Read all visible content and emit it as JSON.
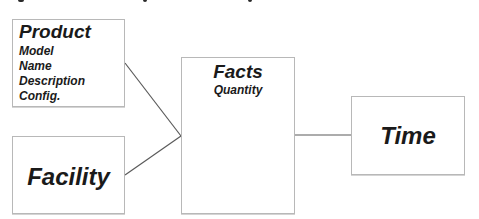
{
  "diagram": {
    "type": "star-schema",
    "entities": {
      "product": {
        "title": "Product",
        "attributes": [
          "Model",
          "Name",
          "Description",
          "Config."
        ]
      },
      "facility": {
        "title": "Facility",
        "attributes": []
      },
      "facts": {
        "title": "Facts",
        "attributes": [
          "Quantity"
        ]
      },
      "time": {
        "title": "Time",
        "attributes": []
      }
    },
    "relationships": [
      {
        "from": "Product",
        "to": "Facts"
      },
      {
        "from": "Facility",
        "to": "Facts"
      },
      {
        "from": "Facts",
        "to": "Time"
      }
    ],
    "colors": {
      "box_border": "#b8b8b8",
      "connector": "#5a5a5a",
      "text": "#1a1a1a"
    }
  }
}
